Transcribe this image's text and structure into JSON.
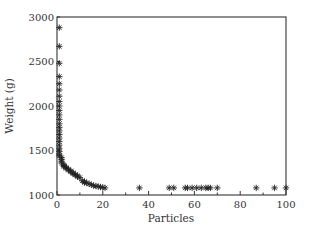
{
  "chart_data": {
    "type": "scatter",
    "title": "",
    "xlabel": "Particles",
    "ylabel": "Weight (g)",
    "xlim": [
      0,
      100
    ],
    "ylim": [
      1000,
      3000
    ],
    "xticks": [
      0,
      20,
      40,
      60,
      80,
      100
    ],
    "yticks": [
      1000,
      1500,
      2000,
      2500,
      3000
    ],
    "x_minor_ticks": [
      10,
      30,
      50,
      70,
      90
    ],
    "grid": false,
    "legend": null,
    "marker": "asterisk",
    "marker_color": "#222222",
    "series": [
      {
        "name": "Weight vs particles",
        "points": [
          [
            1,
            2880
          ],
          [
            1,
            2670
          ],
          [
            1,
            2480
          ],
          [
            1,
            2330
          ],
          [
            1,
            2250
          ],
          [
            1,
            2180
          ],
          [
            1,
            2110
          ],
          [
            1,
            2050
          ],
          [
            1,
            2000
          ],
          [
            1,
            1950
          ],
          [
            1,
            1900
          ],
          [
            1,
            1850
          ],
          [
            1,
            1800
          ],
          [
            1,
            1760
          ],
          [
            1,
            1720
          ],
          [
            1,
            1680
          ],
          [
            1,
            1640
          ],
          [
            1,
            1600
          ],
          [
            1,
            1560
          ],
          [
            1,
            1520
          ],
          [
            1,
            1490
          ],
          [
            1,
            1460
          ],
          [
            1,
            1440
          ],
          [
            2,
            1420
          ],
          [
            2,
            1400
          ],
          [
            2,
            1380
          ],
          [
            2,
            1360
          ],
          [
            3,
            1340
          ],
          [
            3,
            1330
          ],
          [
            3,
            1320
          ],
          [
            4,
            1310
          ],
          [
            4,
            1300
          ],
          [
            5,
            1290
          ],
          [
            5,
            1280
          ],
          [
            6,
            1270
          ],
          [
            6,
            1260
          ],
          [
            7,
            1250
          ],
          [
            7,
            1240
          ],
          [
            8,
            1230
          ],
          [
            8,
            1225
          ],
          [
            9,
            1215
          ],
          [
            9,
            1205
          ],
          [
            10,
            1195
          ],
          [
            11,
            1160
          ],
          [
            12,
            1150
          ],
          [
            12,
            1140
          ],
          [
            13,
            1135
          ],
          [
            14,
            1125
          ],
          [
            15,
            1115
          ],
          [
            16,
            1105
          ],
          [
            17,
            1100
          ],
          [
            18,
            1095
          ],
          [
            19,
            1090
          ],
          [
            20,
            1085
          ],
          [
            21,
            1080
          ],
          [
            36,
            1080
          ],
          [
            49,
            1080
          ],
          [
            51,
            1080
          ],
          [
            56,
            1080
          ],
          [
            57,
            1080
          ],
          [
            59,
            1080
          ],
          [
            61,
            1080
          ],
          [
            63,
            1080
          ],
          [
            65,
            1080
          ],
          [
            66,
            1080
          ],
          [
            67,
            1080
          ],
          [
            70,
            1080
          ],
          [
            87,
            1080
          ],
          [
            95,
            1080
          ],
          [
            100,
            1080
          ]
        ]
      }
    ]
  },
  "layout": {
    "plot_left": 57,
    "plot_right": 286,
    "plot_top": 17,
    "plot_bottom": 195
  }
}
